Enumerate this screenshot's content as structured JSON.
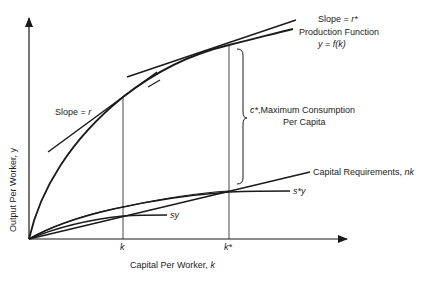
{
  "diagram": {
    "axes": {
      "x_label": "Capital Per Worker, ",
      "x_label_var": "k",
      "y_label": "Output Per Worker, y"
    },
    "ticks": {
      "k": "k",
      "k_star": "k*"
    },
    "labels": {
      "slope_r_star": "Slope = ",
      "slope_r_star_var": "r*",
      "production_function": "Production Function",
      "production_function_eq": "y = f(k)",
      "slope_r": "Slope = ",
      "slope_r_var": "r",
      "c_star_var": "c*",
      "c_star_text": ",Maximum Consumption",
      "c_star_text2": "Per Capita",
      "capital_requirements": "Capital Requirements, ",
      "capital_requirements_var": "nk",
      "s_star_y": "s*y",
      "sy": "sy"
    },
    "colors": {
      "line": "#1a1a1a",
      "background": "#ffffff"
    }
  }
}
